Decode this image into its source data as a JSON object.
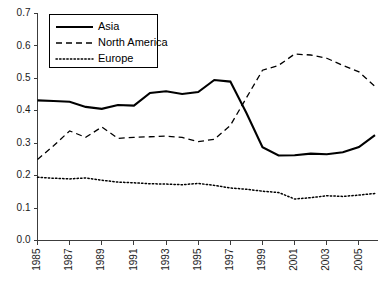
{
  "chart_data": {
    "type": "line",
    "title": "",
    "xlabel": "",
    "ylabel": "",
    "xlim": [
      1985,
      2006
    ],
    "ylim": [
      0.0,
      0.7
    ],
    "grid": false,
    "legend_position": "upper-left",
    "x": [
      1985,
      1986,
      1987,
      1988,
      1989,
      1990,
      1991,
      1992,
      1993,
      1994,
      1995,
      1996,
      1997,
      1998,
      1999,
      2000,
      2001,
      2002,
      2003,
      2004,
      2005,
      2006
    ],
    "xticks": [
      1985,
      1987,
      1989,
      1991,
      1993,
      1995,
      1997,
      1999,
      2001,
      2003,
      2005
    ],
    "xticklabels": [
      "1985",
      "1987",
      "1989",
      "1991",
      "1993",
      "1995",
      "1997",
      "1999",
      "2001",
      "2003",
      "2005"
    ],
    "yticks": [
      0.0,
      0.1,
      0.2,
      0.3,
      0.4,
      0.5,
      0.6,
      0.7
    ],
    "yticklabels": [
      "0.0",
      "0.1",
      "0.2",
      "0.3",
      "0.4",
      "0.5",
      "0.6",
      "0.7"
    ],
    "series": [
      {
        "name": "Asia",
        "style": "solid",
        "color": "#000000",
        "values": [
          0.432,
          0.43,
          0.428,
          0.412,
          0.406,
          0.418,
          0.416,
          0.455,
          0.46,
          0.452,
          0.458,
          0.495,
          0.49,
          0.393,
          0.288,
          0.262,
          0.263,
          0.268,
          0.266,
          0.272,
          0.288,
          0.325
        ]
      },
      {
        "name": "North America",
        "style": "dashed",
        "color": "#000000",
        "values": [
          0.25,
          0.292,
          0.338,
          0.318,
          0.35,
          0.315,
          0.318,
          0.32,
          0.322,
          0.318,
          0.305,
          0.312,
          0.355,
          0.44,
          0.525,
          0.54,
          0.575,
          0.572,
          0.562,
          0.54,
          0.52,
          0.475
        ]
      },
      {
        "name": "Europe",
        "style": "dotted",
        "color": "#000000",
        "values": [
          0.195,
          0.192,
          0.19,
          0.193,
          0.186,
          0.18,
          0.178,
          0.175,
          0.174,
          0.172,
          0.176,
          0.17,
          0.162,
          0.158,
          0.152,
          0.148,
          0.128,
          0.132,
          0.138,
          0.136,
          0.14,
          0.145
        ]
      }
    ]
  },
  "legend": {
    "entries": [
      {
        "label": "Asia"
      },
      {
        "label": "North America"
      },
      {
        "label": "Europe"
      }
    ]
  }
}
